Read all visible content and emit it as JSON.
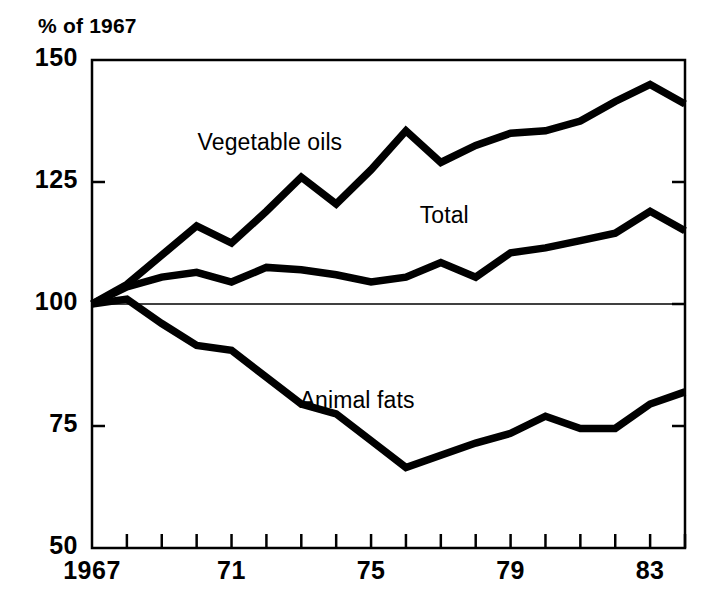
{
  "chart_data": {
    "type": "line",
    "title": "",
    "ylabel": "% of 1967",
    "xlabel": "",
    "ylim": [
      50,
      150
    ],
    "yticks": [
      50,
      75,
      100,
      125,
      150
    ],
    "ytick_labels": [
      "50",
      "75",
      "100",
      "125",
      "150"
    ],
    "xlim": [
      1967,
      1984
    ],
    "x": [
      1967,
      1968,
      1969,
      1970,
      1971,
      1972,
      1973,
      1974,
      1975,
      1976,
      1977,
      1978,
      1979,
      1980,
      1981,
      1982,
      1983,
      1984
    ],
    "xtick_labels": [
      "1967",
      "",
      "",
      "",
      "71",
      "",
      "",
      "",
      "75",
      "",
      "",
      "",
      "79",
      "",
      "",
      "",
      "83",
      ""
    ],
    "xticks_labeled": [
      {
        "year": 1967,
        "label": "1967"
      },
      {
        "year": 1971,
        "label": "71"
      },
      {
        "year": 1975,
        "label": "75"
      },
      {
        "year": 1979,
        "label": "79"
      },
      {
        "year": 1983,
        "label": "83"
      }
    ],
    "grid": false,
    "reference_line": 100,
    "legend_position": "inline-annotations",
    "series": [
      {
        "name": "Vegetable oils",
        "label": "Vegetable oils",
        "label_x": 1972.1,
        "label_y": 133.5,
        "values": [
          100,
          104,
          110,
          116,
          112.5,
          119,
          126,
          120.5,
          127.5,
          135.5,
          129,
          132.5,
          135,
          135.5,
          137.5,
          141.5,
          145,
          141
        ]
      },
      {
        "name": "Total",
        "label": "Total",
        "label_x": 1977.1,
        "label_y": 118.5,
        "values": [
          100,
          103.5,
          105.5,
          106.5,
          104.5,
          107.5,
          107,
          106,
          104.5,
          105.5,
          108.5,
          105.5,
          110.5,
          111.5,
          113,
          114.5,
          119,
          115
        ]
      },
      {
        "name": "Animal fats",
        "label": "Animal fats",
        "label_x": 1974.6,
        "label_y": 80.5,
        "values": [
          100,
          101,
          96,
          91.5,
          90.5,
          85,
          79.5,
          77.5,
          72,
          66.5,
          69,
          71.5,
          73.5,
          77,
          74.5,
          74.5,
          79.5,
          82
        ]
      }
    ],
    "colors": {
      "line": "#000000",
      "axis": "#000000",
      "background": "#ffffff",
      "reference_line": "#000000"
    }
  }
}
